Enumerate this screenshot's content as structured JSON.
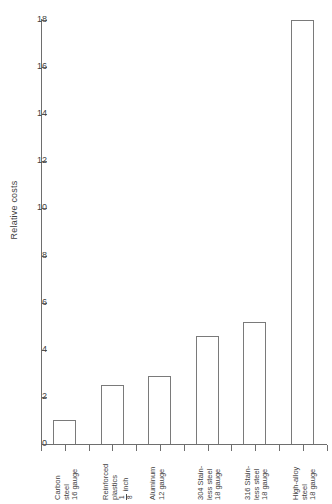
{
  "chart_data": {
    "type": "bar",
    "title": "",
    "xlabel": "",
    "ylabel": "Relative costs",
    "ylim": [
      0,
      18
    ],
    "ytick_step": 2,
    "grid": false,
    "legend": false,
    "categories": [
      "Carbon steel 16 gauge",
      "Reinforced plastics 1/8 inch",
      "Aluminum 12 gauge",
      "304 Stainless steel 18 gauge",
      "316 Stainless steel 18 gauge",
      "High-alloy steel 18 gauge"
    ],
    "values": [
      1.0,
      2.5,
      2.9,
      4.6,
      5.2,
      18.0
    ],
    "ytick_labels": [
      "0",
      "2",
      "4",
      "6",
      "8",
      "10",
      "12",
      "14",
      "16",
      "18"
    ],
    "bar_facecolor": "#ffffff",
    "bar_edgecolor": "#7a7a7a",
    "axis_color": "#6e6e6e",
    "text_color": "#3f3f3f"
  },
  "axes": {
    "y_title": "Relative costs"
  },
  "category_labels": [
    {
      "lines": [
        "Carbon",
        "steel",
        "16 gauge"
      ],
      "fraction": null
    },
    {
      "lines": [
        "Reinforced",
        "plastics"
      ],
      "fraction": {
        "numerator": "1",
        "denominator": "8",
        "suffix": "inch"
      }
    },
    {
      "lines": [
        "Aluminum",
        "12 gauge"
      ],
      "fraction": null
    },
    {
      "lines": [
        "304 Stain-",
        "less steel",
        "18 gauge"
      ],
      "fraction": null
    },
    {
      "lines": [
        "316 Stain-",
        "less steel",
        "18 gauge"
      ],
      "fraction": null
    },
    {
      "lines": [
        "High-alloy",
        "steel",
        "18 gauge"
      ],
      "fraction": null
    }
  ]
}
